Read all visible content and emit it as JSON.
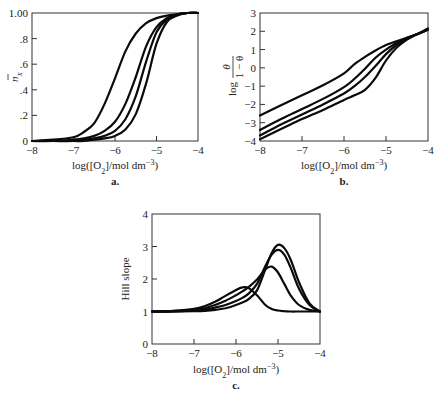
{
  "chart_data": [
    {
      "id": "a",
      "type": "line",
      "panel_label": "a.",
      "xlabel": "log([O2]/mol dm-3)",
      "ylabel": "n̄X",
      "xlim": [
        -8,
        -4
      ],
      "ylim": [
        0,
        1.0
      ],
      "xticks": [
        -8,
        -7,
        -6,
        -5,
        -4
      ],
      "xtick_labels": [
        "−8",
        "−7",
        "−6",
        "−5",
        "−4"
      ],
      "yticks": [
        0,
        0.2,
        0.4,
        0.6,
        0.8,
        1.0
      ],
      "ytick_labels": [
        "0",
        ".2",
        ".4",
        ".6",
        ".8",
        "1.00"
      ],
      "grid": false,
      "legend": null,
      "x": [
        -8,
        -7.5,
        -7,
        -6.75,
        -6.5,
        -6.25,
        -6,
        -5.75,
        -5.5,
        -5.25,
        -5,
        -4.75,
        -4.5,
        -4.25,
        -4
      ],
      "series": [
        {
          "name": "curve 1",
          "values": [
            0.0,
            0.01,
            0.03,
            0.07,
            0.14,
            0.29,
            0.49,
            0.7,
            0.84,
            0.92,
            0.96,
            0.98,
            0.99,
            1.0,
            1.0
          ]
        },
        {
          "name": "curve 2",
          "values": [
            0.0,
            0.0,
            0.01,
            0.02,
            0.04,
            0.08,
            0.15,
            0.29,
            0.5,
            0.74,
            0.89,
            0.96,
            0.99,
            1.0,
            1.0
          ]
        },
        {
          "name": "curve 3",
          "values": [
            0.0,
            0.0,
            0.0,
            0.01,
            0.02,
            0.04,
            0.08,
            0.17,
            0.35,
            0.62,
            0.85,
            0.95,
            0.99,
            1.0,
            1.0
          ]
        },
        {
          "name": "curve 4",
          "values": [
            0.0,
            0.0,
            0.0,
            0.0,
            0.01,
            0.02,
            0.04,
            0.09,
            0.21,
            0.45,
            0.76,
            0.93,
            0.98,
            1.0,
            1.0
          ]
        }
      ]
    },
    {
      "id": "b",
      "type": "line",
      "panel_label": "b.",
      "xlabel": "log([O2]/mol dm-3)",
      "ylabel": "log θ/(1−θ)",
      "xlim": [
        -8,
        -4
      ],
      "ylim": [
        -4,
        3
      ],
      "xticks": [
        -8,
        -7,
        -6,
        -5,
        -4
      ],
      "xtick_labels": [
        "−8",
        "−7",
        "−6",
        "−5",
        "−4"
      ],
      "yticks": [
        -4,
        -3,
        -2,
        -1,
        0,
        1,
        2,
        3
      ],
      "ytick_labels": [
        "−4",
        "−3",
        "−2",
        "−1",
        "0",
        "1",
        "2",
        "3"
      ],
      "grid": false,
      "legend": null,
      "x": [
        -8,
        -7.5,
        -7,
        -6.5,
        -6,
        -5.75,
        -5.5,
        -5.25,
        -5,
        -4.75,
        -4.5,
        -4.25,
        -4
      ],
      "series": [
        {
          "name": "curve 1",
          "values": [
            -2.6,
            -2.05,
            -1.5,
            -0.95,
            -0.3,
            0.2,
            0.6,
            0.95,
            1.25,
            1.45,
            1.65,
            1.85,
            2.1
          ]
        },
        {
          "name": "curve 2",
          "values": [
            -3.4,
            -2.8,
            -2.25,
            -1.7,
            -1.05,
            -0.6,
            -0.05,
            0.55,
            1.0,
            1.35,
            1.65,
            1.85,
            2.1
          ]
        },
        {
          "name": "curve 3",
          "values": [
            -3.7,
            -3.1,
            -2.55,
            -2.0,
            -1.4,
            -1.0,
            -0.5,
            0.1,
            0.75,
            1.25,
            1.6,
            1.85,
            2.1
          ]
        },
        {
          "name": "curve 4",
          "values": [
            -3.9,
            -3.35,
            -2.8,
            -2.3,
            -1.75,
            -1.5,
            -1.2,
            -0.55,
            0.4,
            1.1,
            1.55,
            1.85,
            2.15
          ]
        }
      ]
    },
    {
      "id": "c",
      "type": "line",
      "panel_label": "c.",
      "xlabel": "log([O2]/mol dm-3)",
      "ylabel": "Hill slope",
      "xlim": [
        -8,
        -4
      ],
      "ylim": [
        0,
        4
      ],
      "xticks": [
        -8,
        -7,
        -6,
        -5,
        -4
      ],
      "xtick_labels": [
        "−8",
        "−7",
        "−6",
        "−5",
        "−4"
      ],
      "yticks": [
        0,
        1,
        2,
        3,
        4
      ],
      "ytick_labels": [
        "0",
        "1",
        "2",
        "3",
        "4"
      ],
      "grid": false,
      "legend": null,
      "x": [
        -8,
        -7.5,
        -7,
        -6.75,
        -6.5,
        -6.25,
        -6,
        -5.85,
        -5.7,
        -5.5,
        -5.3,
        -5.15,
        -5,
        -4.85,
        -4.7,
        -4.5,
        -4.25,
        -4
      ],
      "series": [
        {
          "name": "curve 1",
          "values": [
            1.0,
            1.02,
            1.08,
            1.16,
            1.3,
            1.48,
            1.66,
            1.74,
            1.72,
            1.5,
            1.2,
            1.08,
            1.03,
            1.01,
            1.0,
            1.0,
            1.0,
            1.0
          ]
        },
        {
          "name": "curve 2",
          "values": [
            1.0,
            1.01,
            1.05,
            1.1,
            1.2,
            1.33,
            1.5,
            1.62,
            1.75,
            1.98,
            2.3,
            2.38,
            2.2,
            1.85,
            1.5,
            1.2,
            1.05,
            1.0
          ]
        },
        {
          "name": "curve 3",
          "values": [
            1.0,
            1.0,
            1.03,
            1.06,
            1.12,
            1.2,
            1.32,
            1.42,
            1.55,
            1.85,
            2.4,
            2.75,
            2.9,
            2.75,
            2.35,
            1.7,
            1.2,
            1.0
          ]
        },
        {
          "name": "curve 4",
          "values": [
            1.0,
            1.0,
            1.01,
            1.02,
            1.05,
            1.1,
            1.2,
            1.28,
            1.38,
            1.65,
            2.3,
            2.8,
            3.05,
            2.95,
            2.6,
            1.9,
            1.25,
            1.0
          ]
        }
      ]
    }
  ]
}
